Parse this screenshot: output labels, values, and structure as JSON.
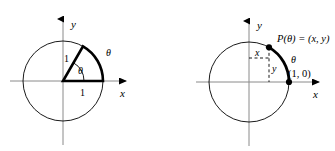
{
  "figure": {
    "background_color": "#ffffff",
    "stroke_color": "#000000",
    "panels": [
      {
        "id": "left-panel",
        "name": "unit-circle-sector-diagram",
        "center": [
          63,
          81
        ],
        "radius": 40,
        "axis": {
          "x_label": "x",
          "y_label": "y",
          "x_min": 10,
          "x_max": 130,
          "y_min": 14,
          "y_max": 145
        },
        "sector": {
          "angle_degrees": 60,
          "radius_label": "1",
          "base_label": "1",
          "interior_angle_label": "θ",
          "arc_label": "θ"
        }
      },
      {
        "id": "right-panel",
        "name": "unit-circle-point-diagram",
        "center": [
          249,
          82
        ],
        "radius": 40,
        "axis": {
          "x_label": "x",
          "y_label": "y",
          "x_min": 196,
          "x_max": 322,
          "y_min": 18,
          "y_max": 146
        },
        "point": {
          "label": "P(θ) = (x, y)",
          "angle_degrees": 60,
          "x_leg_label": "x",
          "y_leg_label": "y"
        },
        "arc_label": "θ",
        "start_point_label": "(1, 0)"
      }
    ]
  },
  "labels": {
    "left_y_axis": "y",
    "left_x_axis": "x",
    "left_radius_one": "1",
    "left_base_one": "1",
    "left_inner_theta": "θ",
    "left_arc_theta": "θ",
    "right_y_axis": "y",
    "right_x_axis": "x",
    "right_point_label": "P(θ) = (x, y)",
    "right_x_leg": "x",
    "right_y_leg": "y",
    "right_arc_theta": "θ",
    "right_one_zero": "(1, 0)"
  }
}
